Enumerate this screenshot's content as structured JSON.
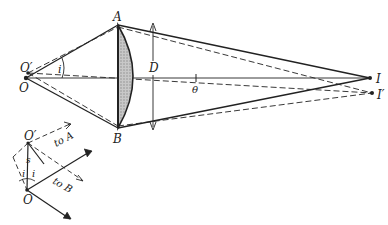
{
  "figure": {
    "points": {
      "O": "O",
      "O_prime": "O′",
      "A": "A",
      "B": "B",
      "I": "I",
      "I_prime": "I′"
    },
    "labels": {
      "angle_i": "i",
      "diameter": "D",
      "angle_theta": "θ"
    },
    "inset": {
      "O": "O",
      "O_prime": "O′",
      "separation": "s",
      "angle_left": "i",
      "angle_right": "i",
      "to_a": "to A",
      "to_b": "to B"
    },
    "colors": {
      "line": "#222222",
      "lens_fill": "#b5b5b5"
    }
  }
}
